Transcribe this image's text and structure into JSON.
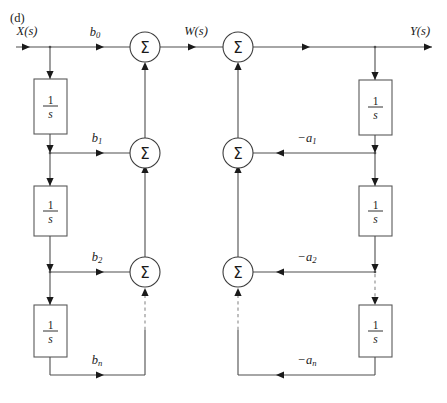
{
  "figure": {
    "panel_label": "(d)",
    "width": 447,
    "height": 403,
    "background": "#ffffff",
    "line_color": "#4e4e4e",
    "dashed_color": "#8a8a8a",
    "text_color": "#1a1a1a"
  },
  "signals": {
    "input": "X(s)",
    "intermediate": "W(s)",
    "output": "Y(s)"
  },
  "sum_symbol": "Σ",
  "integrator": {
    "numerator": "1",
    "denominator": "s",
    "label": "1/s"
  },
  "forward_coefficients": [
    {
      "id": "b0",
      "base": "b",
      "sub": "0",
      "label": "b0"
    },
    {
      "id": "b1",
      "base": "b",
      "sub": "1",
      "label": "b1"
    },
    {
      "id": "b2",
      "base": "b",
      "sub": "2",
      "label": "b2"
    },
    {
      "id": "bn",
      "base": "b",
      "sub": "n",
      "label": "bn"
    }
  ],
  "feedback_coefficients": [
    {
      "id": "a1",
      "base": "−a",
      "sub": "1",
      "label": "-a1"
    },
    {
      "id": "a2",
      "base": "−a",
      "sub": "2",
      "label": "-a2"
    },
    {
      "id": "an",
      "base": "−a",
      "sub": "n",
      "label": "-an"
    }
  ],
  "summing_junctions": {
    "forward": [
      {
        "id": "sum-forward-0",
        "cx": 145,
        "cy": 47
      },
      {
        "id": "sum-forward-1",
        "cx": 145,
        "cy": 153
      },
      {
        "id": "sum-forward-2",
        "cx": 145,
        "cy": 272
      }
    ],
    "feedback": [
      {
        "id": "sum-feedback-0",
        "cx": 238,
        "cy": 47
      },
      {
        "id": "sum-feedback-1",
        "cx": 238,
        "cy": 153
      },
      {
        "id": "sum-feedback-2",
        "cx": 238,
        "cy": 272
      }
    ],
    "radius": 15
  },
  "integrator_blocks": {
    "left": [
      {
        "id": "integrator-left-1",
        "x": 34,
        "y": 79,
        "w": 33,
        "h": 55
      },
      {
        "id": "integrator-left-2",
        "x": 34,
        "y": 186,
        "w": 33,
        "h": 50
      },
      {
        "id": "integrator-left-3",
        "x": 34,
        "y": 305,
        "w": 33,
        "h": 52
      }
    ],
    "right": [
      {
        "id": "integrator-right-1",
        "x": 359,
        "y": 80,
        "w": 33,
        "h": 55
      },
      {
        "id": "integrator-right-2",
        "x": 359,
        "y": 186,
        "w": 33,
        "h": 50
      },
      {
        "id": "integrator-right-3",
        "x": 359,
        "y": 305,
        "w": 33,
        "h": 52
      }
    ]
  },
  "rows": {
    "top_y": 47,
    "row1_y": 153,
    "row2_y": 272,
    "rown_y": 375
  },
  "columns": {
    "input_x": 16,
    "branch_left_x": 50,
    "sum_forward_x": 145,
    "sum_feedback_x": 238,
    "branch_right_x": 375,
    "output_x": 432
  }
}
